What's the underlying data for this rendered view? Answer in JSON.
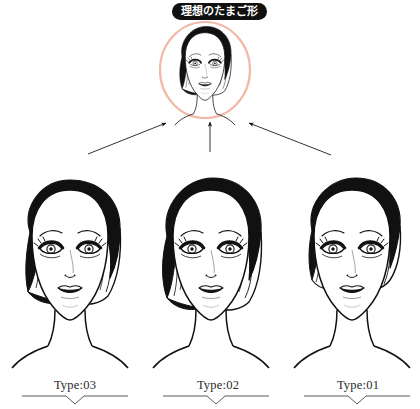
{
  "canvas": {
    "width": 420,
    "height": 409,
    "background": "#ffffff"
  },
  "badge": {
    "text": "理想のたまご形",
    "background": "#101010",
    "color": "#ffffff"
  },
  "ideal": {
    "circle": {
      "name": "ideal-shape-circle",
      "cx": 205,
      "cy": 70,
      "rx": 45,
      "ry": 48,
      "stroke": "#f0b9a8",
      "stroke_width": 2.2
    },
    "face_label": "ideal-egg-shape-face"
  },
  "arrows": [
    {
      "name": "arrow-from-type03",
      "x1": 88,
      "y1": 154,
      "x2": 166,
      "y2": 123
    },
    {
      "name": "arrow-from-type02",
      "x1": 210,
      "y1": 152,
      "x2": 210,
      "y2": 122
    },
    {
      "name": "arrow-from-type01",
      "x1": 331,
      "y1": 155,
      "x2": 249,
      "y2": 123
    }
  ],
  "faces": [
    {
      "name": "face-type03",
      "hairstyle": "side-swept-bob",
      "cx": 70,
      "cy": 265
    },
    {
      "name": "face-type02",
      "hairstyle": "rounded-bob",
      "cx": 211,
      "cy": 265
    },
    {
      "name": "face-type01",
      "hairstyle": "pulled-back-updo",
      "cx": 352,
      "cy": 265
    }
  ],
  "types": [
    {
      "label": "Type:03",
      "underline_color": "#5a5a5a"
    },
    {
      "label": "Type:02",
      "underline_color": "#5a5a5a"
    },
    {
      "label": "Type:01",
      "underline_color": "#5a5a5a"
    }
  ],
  "colors": {
    "ink": "#111111",
    "pink": "#f0b9a8",
    "text": "#2a2a2a",
    "rule": "#5a5a5a"
  }
}
